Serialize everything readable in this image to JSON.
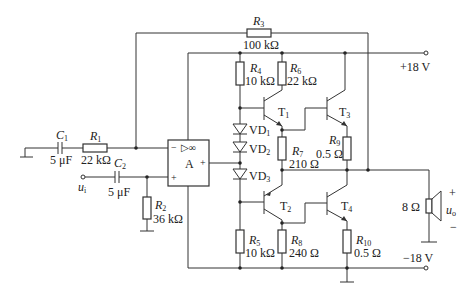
{
  "circuit": {
    "supply_pos": "+18 V",
    "supply_neg": "−18 V",
    "opamp": {
      "name": "A",
      "symbol": "▷∞",
      "minus": "−",
      "plus": "+",
      "out": "+"
    },
    "input": {
      "name": "u",
      "sub": "i"
    },
    "output": {
      "name": "u",
      "sub": "o",
      "plus": "+",
      "minus": "−"
    },
    "speaker": "8 Ω",
    "components": {
      "C1": {
        "name": "C",
        "sub": "1",
        "value": "5 μF"
      },
      "C2": {
        "name": "C",
        "sub": "2",
        "value": "5 μF"
      },
      "R1": {
        "name": "R",
        "sub": "1",
        "value": "22 kΩ"
      },
      "R2": {
        "name": "R",
        "sub": "2",
        "value": "36 kΩ"
      },
      "R3": {
        "name": "R",
        "sub": "3",
        "value": "100 kΩ"
      },
      "R4": {
        "name": "R",
        "sub": "4",
        "value": "10 kΩ"
      },
      "R5": {
        "name": "R",
        "sub": "5",
        "value": "10 kΩ"
      },
      "R6": {
        "name": "R",
        "sub": "6",
        "value": "22 kΩ"
      },
      "R7": {
        "name": "R",
        "sub": "7",
        "value": "210 Ω"
      },
      "R8": {
        "name": "R",
        "sub": "8",
        "value": "240 Ω"
      },
      "R9": {
        "name": "R",
        "sub": "9",
        "value": "0.5 Ω"
      },
      "R10": {
        "name": "R",
        "sub": "10",
        "value": "0.5 Ω"
      },
      "VD1": {
        "name": "VD",
        "sub": "1"
      },
      "VD2": {
        "name": "VD",
        "sub": "2"
      },
      "VD3": {
        "name": "VD",
        "sub": "3"
      },
      "T1": {
        "name": "T",
        "sub": "1"
      },
      "T2": {
        "name": "T",
        "sub": "2"
      },
      "T3": {
        "name": "T",
        "sub": "3"
      },
      "T4": {
        "name": "T",
        "sub": "4"
      }
    }
  }
}
